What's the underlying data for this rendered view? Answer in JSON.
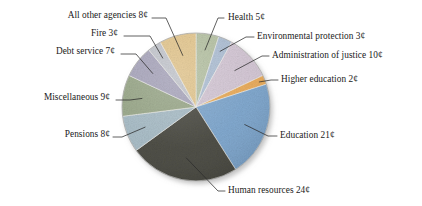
{
  "chart_data": {
    "type": "pie",
    "title": "",
    "subtitle": "",
    "xlabel": "",
    "ylabel": "",
    "unit": "¢",
    "total": 100,
    "grid": false,
    "legend_position": "none",
    "label_style": "leader-lines",
    "start_angle_deg": 0,
    "direction": "clockwise",
    "categories": [
      "Health",
      "Environmental protection",
      "Administration of justice",
      "Higher education",
      "Education",
      "Human resources",
      "Pensions",
      "Miscellaneous",
      "Debt service",
      "Fire",
      "All other agencies"
    ],
    "values": [
      5,
      3,
      10,
      2,
      21,
      24,
      8,
      9,
      7,
      3,
      8
    ],
    "colors": [
      "#b6c2a4",
      "#aebfd4",
      "#d3c6d4",
      "#e9ab5a",
      "#7ea6cd",
      "#4a4a42",
      "#a8bcc6",
      "#9aa88a",
      "#a9a6bc",
      "#c3c6cd",
      "#e3c68e"
    ],
    "slices": [
      {
        "label": "Health",
        "value": 5,
        "display": "Health 5¢",
        "color": "#b6c2a4"
      },
      {
        "label": "Environmental protection",
        "value": 3,
        "display": "Environmental protection 3¢",
        "color": "#aebfd4"
      },
      {
        "label": "Administration of justice",
        "value": 10,
        "display": "Administration of justice 10¢",
        "color": "#d3c6d4"
      },
      {
        "label": "Higher education",
        "value": 2,
        "display": "Higher education 2¢",
        "color": "#e9ab5a"
      },
      {
        "label": "Education",
        "value": 21,
        "display": "Education 21¢",
        "color": "#7ea6cd"
      },
      {
        "label": "Human resources",
        "value": 24,
        "display": "Human resources 24¢",
        "color": "#4a4a42"
      },
      {
        "label": "Pensions",
        "value": 8,
        "display": "Pensions 8¢",
        "color": "#a8bcc6"
      },
      {
        "label": "Miscellaneous",
        "value": 9,
        "display": "Miscellaneous 9¢",
        "color": "#9aa88a"
      },
      {
        "label": "Debt service",
        "value": 7,
        "display": "Debt service 7¢",
        "color": "#a9a6bc"
      },
      {
        "label": "Fire",
        "value": 3,
        "display": "Fire 3¢",
        "color": "#c3c6cd"
      },
      {
        "label": "All other agencies",
        "value": 8,
        "display": "All other agencies 8¢",
        "color": "#e3c68e"
      }
    ]
  },
  "labels": {
    "all_other_agencies": "All other agencies 8¢",
    "fire": "Fire 3¢",
    "debt_service": "Debt service 7¢",
    "miscellaneous": "Miscellaneous 9¢",
    "pensions": "Pensions 8¢",
    "human_resources": "Human resources 24¢",
    "education": "Education 21¢",
    "higher_education": "Higher education 2¢",
    "administration_of_justice": "Administration of justice 10¢",
    "environmental_protection": "Environmental protection 3¢",
    "health": "Health 5¢"
  }
}
